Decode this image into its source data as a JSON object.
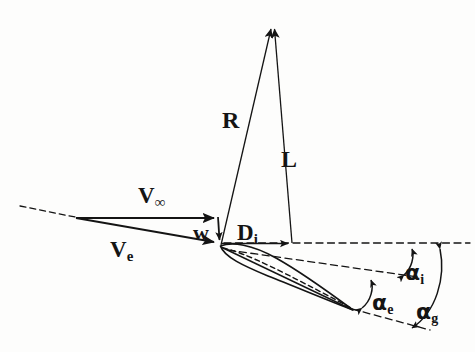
{
  "figure": {
    "type": "technical-line-diagram",
    "background_color": "#fdfdfc",
    "ink_color": "#141414"
  },
  "labels": {
    "v_infinity": {
      "base": "V",
      "sub": "∞",
      "x": 138,
      "y": 184,
      "name": "freestream-velocity-label"
    },
    "v_e": {
      "base": "V",
      "sub": "e",
      "x": 110,
      "y": 238,
      "name": "effective-velocity-label"
    },
    "w": {
      "base": "w",
      "sub": "",
      "x": 193,
      "y": 222,
      "name": "induced-downwash-label"
    },
    "r": {
      "base": "R",
      "sub": "",
      "x": 222,
      "y": 108,
      "name": "resultant-force-label"
    },
    "l": {
      "base": "L",
      "sub": "",
      "x": 281,
      "y": 147,
      "name": "lift-force-label"
    },
    "d_i": {
      "base": "D",
      "sub": "i",
      "x": 237,
      "y": 221,
      "name": "induced-drag-label"
    },
    "alpha_i": {
      "base": "α",
      "sub": "i",
      "x": 405,
      "y": 262,
      "name": "induced-angle-label"
    },
    "alpha_e": {
      "base": "α",
      "sub": "e",
      "x": 372,
      "y": 292,
      "name": "effective-angle-label"
    },
    "alpha_g": {
      "base": "α",
      "sub": "g",
      "x": 416,
      "y": 301,
      "name": "geometric-angle-label"
    }
  },
  "geometry": {
    "origin": {
      "x": 75,
      "y": 218
    },
    "airfoil_leading_edge": {
      "x": 220,
      "y": 246
    },
    "airfoil_trailing_edge": {
      "x": 353,
      "y": 310
    },
    "resultant_tip": {
      "x": 272,
      "y": 22
    },
    "lift_tip": {
      "x": 292,
      "y": 22
    },
    "induced_drag_tip": {
      "x": 292,
      "y": 243
    },
    "freestream_tip": {
      "x": 218,
      "y": 218
    },
    "downwash_tip": {
      "x": 220,
      "y": 243
    },
    "horizontal_reference_y": 243,
    "horizontal_reference_x_end": 470,
    "effective_flow_dashed_end": {
      "x": 418,
      "y": 277
    },
    "chord_dashed_end": {
      "x": 430,
      "y": 330
    }
  },
  "arcs": {
    "alpha_i": {
      "from": "effective-flow-line",
      "to": "horizontal-reference",
      "apex_x": 412
    },
    "alpha_e": {
      "from": "chord-line",
      "to": "effective-flow-line",
      "apex_x": 370
    },
    "alpha_g": {
      "from": "horizontal-reference",
      "to": "chord-line",
      "apex_x": 440
    }
  }
}
